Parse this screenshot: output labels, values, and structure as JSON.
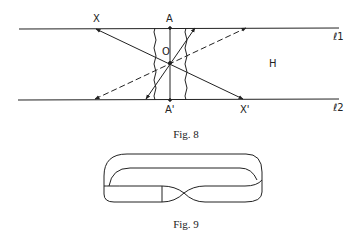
{
  "fig8": {
    "caption": "Fig. 8",
    "labels": {
      "X": "X",
      "A": "A",
      "O": "O",
      "H": "H",
      "A_prime": "A'",
      "X_prime": "X'",
      "l1": "ℓ1",
      "l2": "ℓ2"
    }
  },
  "fig9": {
    "caption": "Fig. 9"
  },
  "colors": {
    "line": "#222222",
    "background": "#ffffff"
  }
}
